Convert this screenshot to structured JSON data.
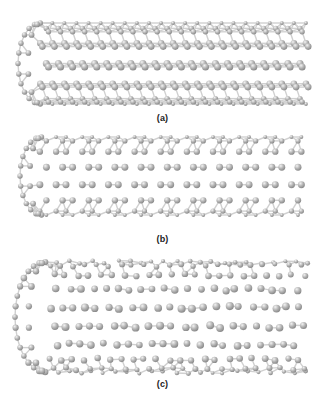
{
  "figure": {
    "background": "#ffffff",
    "atom_color": "#b4b4b4",
    "atom_highlight": "#f2f2f2",
    "atom_shadow": "#8a8a8a",
    "bond_color": "#d0d0d0",
    "panels": [
      {
        "id": "a",
        "label": "(a)",
        "description": "zigzag carbon nanotube with capped left end",
        "pattern": "zigzag",
        "bounds": {
          "x0": 18,
          "y0": 23,
          "x1": 306,
          "y1": 104
        },
        "label_y": 113,
        "columns": 22,
        "rows": 6
      },
      {
        "id": "b",
        "label": "(b)",
        "description": "armchair carbon nanotube with capped left end",
        "pattern": "armchair",
        "bounds": {
          "x0": 20,
          "y0": 137,
          "x1": 303,
          "y1": 215
        },
        "label_y": 234,
        "columns": 20,
        "rows": 7
      },
      {
        "id": "c",
        "label": "(c)",
        "description": "chiral/defective carbon nanotube with capped left end",
        "pattern": "chiral",
        "bounds": {
          "x0": 15,
          "y0": 262,
          "x1": 308,
          "y1": 372
        },
        "label_y": 379,
        "columns": 22,
        "rows": 9
      }
    ]
  }
}
